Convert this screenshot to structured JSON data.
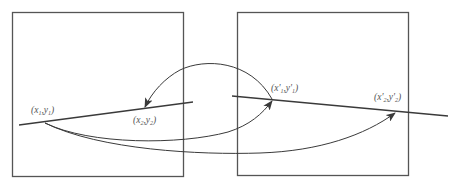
{
  "colors": {
    "stroke": "#3a3a3a",
    "text": "#555555",
    "background": "#ffffff"
  },
  "left_frame": {
    "name": "image-1"
  },
  "right_frame": {
    "name": "image-2"
  },
  "labels": {
    "p1": {
      "var": "x",
      "sub": "1",
      "var2": "y",
      "sub2": "1",
      "prime": ""
    },
    "p2": {
      "var": "x",
      "sub": "2",
      "var2": "y",
      "sub2": "2",
      "prime": ""
    },
    "p1p": {
      "var": "x",
      "sub": "1",
      "var2": "y",
      "sub2": "1",
      "prime": "'"
    },
    "p2p": {
      "var": "x",
      "sub": "2",
      "var2": "y",
      "sub2": "2",
      "prime": "'"
    }
  },
  "text": {
    "open": "(",
    "comma": ",",
    "close": ")"
  }
}
